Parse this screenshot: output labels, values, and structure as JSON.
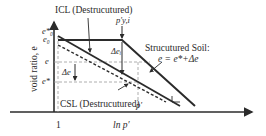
{
  "diagram": {
    "y_axis_label": "void ratio, e",
    "x_axis_label": "ln p′",
    "x_tick_label": "1",
    "y_ticks": {
      "e_star_0": "e*₀",
      "e_0": "e₀",
      "e": "e",
      "e_star": "e*"
    },
    "curves": {
      "icl_label": "ICL (Destrucutured)",
      "csl_label": "CSL (Destrucutured)",
      "structured_label_line1": "Strucutured Soil:",
      "structured_label_line2": "e = e*+Δe"
    },
    "annotations": {
      "yield_stress": "p′y,i",
      "delta_e_i": "Δeᵢ",
      "delta_e": "Δe",
      "p_prime": "p′",
      "slope_marker": "slope"
    },
    "colors": {
      "line": "#2b2b2b",
      "dashed": "#555555",
      "guide": "#9a9a9a",
      "background": "#ffffff"
    }
  }
}
